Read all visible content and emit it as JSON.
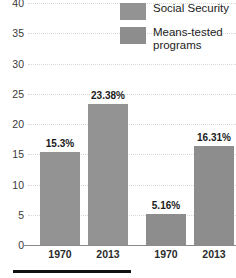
{
  "chart_data": {
    "type": "bar",
    "title": "",
    "subtitle": "",
    "xlabel": "",
    "ylabel": "",
    "ylim": [
      0,
      40
    ],
    "ytick_step": 5,
    "yticks": [
      0,
      5,
      10,
      15,
      20,
      25,
      30,
      35,
      40
    ],
    "ytick_labels": [
      "0",
      "5",
      "10",
      "15",
      "20",
      "25",
      "30",
      "35",
      "40"
    ],
    "grid": true,
    "grid_style": "dotted",
    "legend_position": "top-right",
    "value_suffix": "%",
    "categories": [
      "1970",
      "2013"
    ],
    "series": [
      {
        "name": "Social Security",
        "color": "#939393",
        "values": [
          15.3,
          23.38
        ],
        "data_labels": [
          "15.3%",
          "23.38%"
        ]
      },
      {
        "name": "Means-tested programs",
        "color": "#8d8d8d",
        "values": [
          5.16,
          16.31
        ],
        "data_labels": [
          "5.16%",
          "16.31%"
        ]
      }
    ],
    "bars": [
      {
        "group": "Social Security",
        "category": "1970",
        "value": 15.3,
        "label": "15.3%",
        "series_index": 0
      },
      {
        "group": "Social Security",
        "category": "2013",
        "value": 23.38,
        "label": "23.38%",
        "series_index": 0
      },
      {
        "group": "Means-tested programs",
        "category": "1970",
        "value": 5.16,
        "label": "5.16%",
        "series_index": 1
      },
      {
        "group": "Means-tested programs",
        "category": "2013",
        "value": 16.31,
        "label": "16.31%",
        "series_index": 1
      }
    ],
    "xtick_labels": [
      "1970",
      "2013",
      "1970",
      "2013"
    ]
  },
  "legend": {
    "items": [
      {
        "label": "Social Security",
        "color": "#939393"
      },
      {
        "label": "Means-tested programs",
        "color": "#8d8d8d"
      }
    ]
  },
  "colors": {
    "bar_social_security": "#939393",
    "bar_means_tested": "#8d8d8d",
    "gridline": "#d8d8d8",
    "axis": "#8a8a8a",
    "tick_text": "#3a3a3a",
    "label_text": "#1a1a1a",
    "rule": "#111111",
    "background": "#ffffff"
  },
  "footer_rule": {
    "present": true
  }
}
